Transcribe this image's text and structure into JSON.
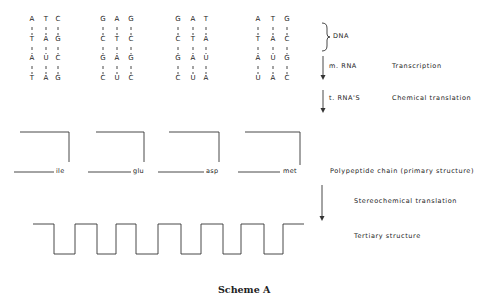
{
  "codon_groups": [
    {
      "rows": [
        [
          "A",
          "T",
          "C"
        ],
        [
          "T",
          "A",
          "G"
        ],
        [
          "A",
          "U",
          "C"
        ],
        [
          "T",
          "A",
          "G"
        ]
      ],
      "amino_acid": "ile"
    },
    {
      "rows": [
        [
          "G",
          "A",
          "G"
        ],
        [
          "C",
          "T",
          "C"
        ],
        [
          "G",
          "A",
          "G"
        ],
        [
          "C",
          "U",
          "C"
        ]
      ],
      "amino_acid": "glu"
    },
    {
      "rows": [
        [
          "G",
          "A",
          "T"
        ],
        [
          "C",
          "T",
          "A"
        ],
        [
          "G",
          "A",
          "U"
        ],
        [
          "C",
          "U",
          "A"
        ]
      ],
      "amino_acid": "asp"
    },
    {
      "rows": [
        [
          "A",
          "T",
          "G"
        ],
        [
          "T",
          "A",
          "C"
        ],
        [
          "A",
          "U",
          "G"
        ],
        [
          "U",
          "A",
          "C"
        ]
      ],
      "amino_acid": "met"
    }
  ],
  "labels": {
    "dna": "DNA",
    "mrna": "m. RNA",
    "transcription": "Transcription",
    "trna": "t. RNA'S",
    "chemical_translation": "Chemical translation",
    "polypeptide": "Polypeptide chain (primary structure)",
    "stereochemical": "Stereochemical translation",
    "tertiary": "Tertiary structure"
  },
  "caption": "Scheme A"
}
